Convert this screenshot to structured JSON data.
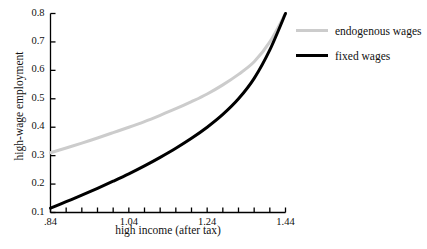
{
  "chart_data": {
    "type": "line",
    "title": "",
    "xlabel": "high income (after tax)",
    "ylabel": "high-wage employment",
    "xlim": [
      0.84,
      1.44
    ],
    "ylim": [
      0.1,
      0.8
    ],
    "grid": false,
    "legend_position": "right",
    "x_tick_labels": [
      ".84",
      "1.04",
      "1.24",
      "1.44"
    ],
    "x_tick_values": [
      0.84,
      1.04,
      1.24,
      1.44
    ],
    "x_minor_tick_step": 0.04,
    "y_tick_labels": [
      "0.1",
      "0.2",
      "0.3",
      "0.4",
      "0.5",
      "0.6",
      "0.7",
      "0.8"
    ],
    "y_tick_values": [
      0.1,
      0.2,
      0.3,
      0.4,
      0.5,
      0.6,
      0.7,
      0.8
    ],
    "x": [
      0.84,
      0.88,
      0.92,
      0.96,
      1.0,
      1.04,
      1.08,
      1.12,
      1.16,
      1.2,
      1.24,
      1.28,
      1.32,
      1.36,
      1.4,
      1.44
    ],
    "series": [
      {
        "name": "endogenous wages",
        "color": "#cccccc",
        "width": 3.0,
        "values": [
          0.31,
          0.327,
          0.344,
          0.362,
          0.381,
          0.4,
          0.42,
          0.442,
          0.465,
          0.49,
          0.517,
          0.549,
          0.586,
          0.63,
          0.7,
          0.8
        ]
      },
      {
        "name": "fixed wages",
        "color": "#000000",
        "width": 3.0,
        "values": [
          0.115,
          0.138,
          0.161,
          0.185,
          0.21,
          0.236,
          0.264,
          0.294,
          0.326,
          0.361,
          0.4,
          0.445,
          0.5,
          0.572,
          0.672,
          0.8
        ]
      }
    ]
  },
  "legend": {
    "items": [
      {
        "label": "endogenous wages"
      },
      {
        "label": "fixed wages"
      }
    ]
  },
  "axes": {
    "y_title": "high-wage employment",
    "x_title": "high income (after tax)"
  }
}
